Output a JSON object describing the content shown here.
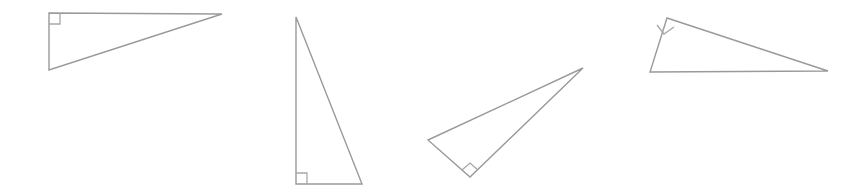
{
  "canvas": {
    "width": 863,
    "height": 195,
    "background_color": "#ffffff",
    "description": "Four outlined right triangles in various orientations"
  },
  "style": {
    "stroke_color": "#9a9a9a",
    "right_angle_mark_color": "#a8a8a8",
    "stroke_width": 1.4,
    "fill": "none"
  },
  "shapes": [
    {
      "name": "triangle-1",
      "label": "Right triangle 1",
      "points": "49,13 222,14 49,70",
      "right_angle_vertex": "49,13",
      "right_angle_mark": "49,24 60,24 60,13",
      "orientation": "right angle at top-left"
    },
    {
      "name": "triangle-2",
      "label": "Right triangle 2",
      "points": "296,17 362,184 296,184",
      "right_angle_vertex": "296,184",
      "right_angle_mark": "296,173 307,173 307,184",
      "orientation": "right angle at bottom-left"
    },
    {
      "name": "triangle-3",
      "label": "Right triangle 3",
      "points": "428,140 583,68 470,177",
      "right_angle_vertex": "470,177",
      "right_angle_mark": "462,170 470,163 478,170",
      "orientation": "right angle at bottom vertex, tilted"
    },
    {
      "name": "triangle-4",
      "label": "Right triangle 4",
      "points": "667,18 828,71 650,72",
      "right_angle_vertex": "667,18",
      "right_angle_mark": "657,25 664,34 674,27",
      "orientation": "right angle at top-left, tilted"
    }
  ]
}
